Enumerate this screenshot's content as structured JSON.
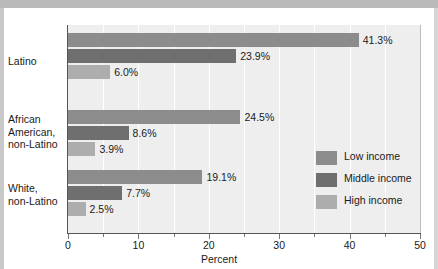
{
  "chart_data": {
    "type": "bar",
    "orientation": "horizontal",
    "title": "",
    "xlabel": "Percent",
    "ylabel": "",
    "xlim": [
      0,
      50
    ],
    "xticks": [
      0,
      10,
      20,
      30,
      40,
      50
    ],
    "xtick_labels": [
      "0",
      "10",
      "20",
      "30",
      "40",
      "50"
    ],
    "minor_xticks": [
      5,
      15,
      25,
      35,
      45
    ],
    "grid": "vertical-white-gridlines-every-5",
    "legend_position": "inside-lower-right",
    "categories": [
      "Latino",
      "African American, non-Latino",
      "White, non-Latino"
    ],
    "category_labels": [
      [
        "Latino"
      ],
      [
        "African",
        "American,",
        "non-Latino"
      ],
      [
        "White,",
        "non-Latino"
      ]
    ],
    "series": [
      {
        "name": "Low income",
        "color": "#8c8c8c",
        "values": [
          41.3,
          24.5,
          19.1
        ],
        "value_labels": [
          "41.3%",
          "24.5%",
          "19.1%"
        ]
      },
      {
        "name": "Middle income",
        "color": "#6f6f6f",
        "values": [
          23.9,
          8.6,
          7.7
        ],
        "value_labels": [
          "23.9%",
          "8.6%",
          "7.7%"
        ]
      },
      {
        "name": "High income",
        "color": "#adadad",
        "values": [
          6.0,
          3.9,
          2.5
        ],
        "value_labels": [
          "6.0%",
          "3.9%",
          "2.5%"
        ]
      }
    ]
  },
  "legend": {
    "items": [
      {
        "label": "Low income",
        "color": "#8c8c8c",
        "key": "low"
      },
      {
        "label": "Middle income",
        "color": "#6f6f6f",
        "key": "middle"
      },
      {
        "label": "High income",
        "color": "#adadad",
        "key": "high"
      }
    ]
  },
  "axis": {
    "x_title": "Percent"
  },
  "colors": {
    "plot_background": "#eeeeee",
    "gridline": "#ffffff",
    "axis": "#555555",
    "text": "#1a1a1a",
    "low_income": "#8c8c8c",
    "middle_income": "#6f6f6f",
    "high_income": "#adadad"
  }
}
